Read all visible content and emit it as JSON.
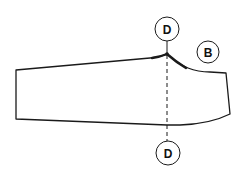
{
  "diagram": {
    "type": "sewing-pattern-piece",
    "labels": {
      "marker_top": "D",
      "marker_bottom": "D",
      "marker_piece": "B"
    },
    "colors": {
      "stroke": "#1a1a1a",
      "background": "#ffffff"
    }
  }
}
